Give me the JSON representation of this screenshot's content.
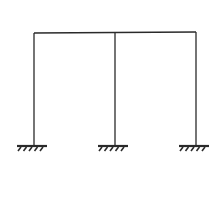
{
  "diagram": {
    "type": "portal-frame",
    "stroke_color": "#2a2a2a",
    "beam": {
      "x1": 34,
      "y1": 33,
      "x2": 196,
      "y2": 32
    },
    "columns": [
      {
        "name": "left",
        "x": 34,
        "top": 33,
        "bottom": 146
      },
      {
        "name": "middle",
        "x": 115,
        "top": 33,
        "bottom": 146
      },
      {
        "name": "right",
        "x": 196,
        "top": 32,
        "bottom": 146
      }
    ],
    "supports": [
      {
        "name": "left",
        "type": "fixed",
        "x": 34,
        "y": 146
      },
      {
        "name": "middle",
        "type": "fixed",
        "x": 115,
        "y": 146
      },
      {
        "name": "right",
        "type": "fixed",
        "x": 196,
        "y": 146
      }
    ]
  }
}
